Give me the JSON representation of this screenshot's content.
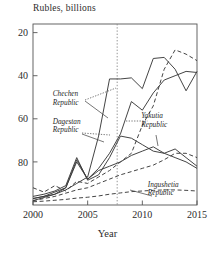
{
  "chart_data": {
    "type": "line",
    "title": "",
    "ylabel": "Rubles, billions",
    "xlabel": "Year",
    "xlim": [
      2000,
      2015
    ],
    "ylim": [
      0,
      84
    ],
    "yticks": [
      20,
      40,
      60,
      80
    ],
    "xticks": [
      2000,
      2005,
      2010,
      2015
    ],
    "grid": false,
    "legend": "inline-annotations",
    "vertical_reference_line": {
      "x": 2007.7,
      "style": "dotted"
    },
    "x": [
      2000,
      2001,
      2002,
      2003,
      2004,
      2005,
      2006,
      2007,
      2008,
      2009,
      2010,
      2011,
      2012,
      2013,
      2014,
      2015
    ],
    "series": [
      {
        "name": "Chechen Republic",
        "style": "solid",
        "values": [
          2,
          3.5,
          5,
          7,
          10,
          13,
          32,
          58.5,
          58.5,
          59,
          54,
          68,
          68.5,
          63,
          53,
          62
        ]
      },
      {
        "name": "Dagestan Republic",
        "style": "solid",
        "values": [
          4,
          5,
          6.5,
          9,
          22,
          11.5,
          14,
          22,
          32,
          31,
          28,
          25,
          24,
          22,
          20,
          17
        ]
      },
      {
        "name": "Yakutia Republic",
        "style": "solid",
        "values": [
          3,
          4,
          5,
          8,
          21,
          12,
          17,
          24,
          33,
          48,
          44,
          52,
          58,
          60,
          62,
          61.5
        ]
      },
      {
        "name": "Ingushetia Republic",
        "style": "dashed",
        "values": [
          1.5,
          1.8,
          2.2,
          2.6,
          3.2,
          3.6,
          4.2,
          5,
          5.6,
          6.2,
          6.5,
          6.8,
          7,
          7,
          6.8,
          6.5
        ]
      },
      {
        "name": "unlabeled-series-1",
        "style": "dashed",
        "values": [
          8,
          6,
          9,
          6.5,
          11,
          10,
          13,
          16,
          20,
          24,
          37,
          46,
          63,
          72,
          70,
          67
        ]
      },
      {
        "name": "unlabeled-series-2",
        "style": "dashed",
        "values": [
          2,
          3,
          4,
          5.5,
          7,
          8,
          10,
          12,
          14,
          15.5,
          17,
          18.5,
          21,
          24,
          24,
          22
        ]
      },
      {
        "name": "unlabeled-series-3",
        "style": "solid",
        "values": [
          3,
          4,
          6,
          8,
          20,
          12,
          16,
          18,
          20,
          23,
          25,
          27,
          24,
          26,
          22,
          18
        ]
      }
    ],
    "annotations": [
      {
        "text_line1": "Chechen",
        "text_line2": "Republic",
        "x": 0.12,
        "y": 0.4
      },
      {
        "text_line1": "Dagestan",
        "text_line2": "Republic",
        "x": 0.12,
        "y": 0.55
      },
      {
        "text_line1": "Yakutia",
        "text_line2": "Republic",
        "x": 0.66,
        "y": 0.52
      },
      {
        "text_line1": "Ingushetia",
        "text_line2": "Republic",
        "x": 0.7,
        "y": 0.9
      }
    ]
  },
  "axis": {
    "y_title": "Rubles, billions",
    "x_title": "Year",
    "y_ticks": [
      "80",
      "60",
      "40",
      "20"
    ],
    "x_ticks": [
      "2000",
      "2005",
      "2010",
      "2015"
    ]
  },
  "labels": {
    "chechen_1": "Chechen",
    "chechen_2": "Republic",
    "dagestan_1": "Dagestan",
    "dagestan_2": "Republic",
    "yakutia_1": "Yakutia",
    "yakutia_2": "Republic",
    "ingushetia_1": "Ingushetia",
    "ingushetia_2": "Republic"
  },
  "colors": {
    "line": "#3a3a3a",
    "frame": "#555555",
    "text": "#2c2c2c"
  }
}
